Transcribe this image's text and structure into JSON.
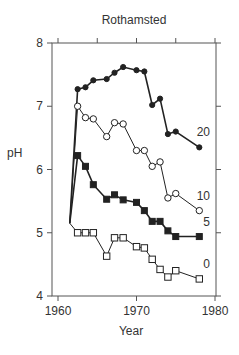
{
  "chart_data": {
    "type": "line",
    "title": "Rothamsted",
    "xlabel": "Year",
    "ylabel": "pH",
    "xlim": [
      1958,
      1980
    ],
    "ylim": [
      4,
      8
    ],
    "xticks": [
      1960,
      1970,
      1980
    ],
    "yticks": [
      4,
      5,
      6,
      7,
      8
    ],
    "grid": false,
    "legend": "inline labels at right end of each series",
    "series": [
      {
        "name": "20",
        "marker": "filled-circle",
        "x": [
          1961.5,
          1962.5,
          1963.5,
          1964.5,
          1966.2,
          1967.2,
          1968.3,
          1970.0,
          1971.0,
          1972.0,
          1973.0,
          1974.0,
          1975.0,
          1978.0
        ],
        "y": [
          5.15,
          7.27,
          7.3,
          7.41,
          7.43,
          7.53,
          7.62,
          7.57,
          7.55,
          7.02,
          7.12,
          6.56,
          6.6,
          6.35
        ]
      },
      {
        "name": "10",
        "marker": "open-circle",
        "x": [
          1961.5,
          1962.5,
          1963.5,
          1964.5,
          1966.2,
          1967.2,
          1968.3,
          1970.0,
          1971.0,
          1972.0,
          1973.0,
          1974.0,
          1975.0,
          1978.0
        ],
        "y": [
          5.15,
          7.0,
          6.82,
          6.8,
          6.52,
          6.74,
          6.72,
          6.3,
          6.3,
          6.05,
          6.12,
          5.55,
          5.62,
          5.35
        ]
      },
      {
        "name": "5",
        "marker": "filled-square",
        "x": [
          1961.5,
          1962.5,
          1963.5,
          1964.5,
          1966.2,
          1967.2,
          1968.3,
          1970.0,
          1971.0,
          1972.0,
          1973.0,
          1974.0,
          1975.0,
          1978.0
        ],
        "y": [
          5.15,
          6.22,
          6.05,
          5.76,
          5.53,
          5.6,
          5.52,
          5.48,
          5.35,
          5.18,
          5.18,
          5.03,
          4.94,
          4.94
        ]
      },
      {
        "name": "0",
        "marker": "open-square",
        "x": [
          1961.5,
          1962.5,
          1963.5,
          1964.5,
          1966.2,
          1967.2,
          1968.3,
          1970.0,
          1971.0,
          1972.0,
          1973.0,
          1974.0,
          1975.0,
          1978.0
        ],
        "y": [
          5.15,
          5.0,
          5.0,
          5.0,
          4.63,
          4.92,
          4.92,
          4.78,
          4.76,
          4.58,
          4.42,
          4.3,
          4.4,
          4.27
        ]
      }
    ]
  }
}
